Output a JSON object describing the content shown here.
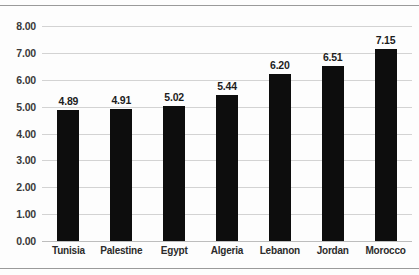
{
  "chart_data": {
    "type": "bar",
    "title": "",
    "subtitle": "",
    "xlabel": "",
    "ylabel": "",
    "categories": [
      "Tunisia",
      "Palestine",
      "Egypt",
      "Algeria",
      "Lebanon",
      "Jordan",
      "Morocco"
    ],
    "values": [
      4.89,
      4.91,
      5.02,
      5.44,
      6.2,
      6.51,
      7.15
    ],
    "value_labels": [
      "4.89",
      "4.91",
      "5.02",
      "5.44",
      "6.20",
      "6.51",
      "7.15"
    ],
    "ylim": [
      0,
      8
    ],
    "ytick_labels": [
      "0.00",
      "1.00",
      "2.00",
      "3.00",
      "4.00",
      "5.00",
      "6.00",
      "7.00",
      "8.00"
    ],
    "ytick_values": [
      0,
      1,
      2,
      3,
      4,
      5,
      6,
      7,
      8
    ],
    "grid": true,
    "legend": null,
    "legend_position": "none",
    "series": [
      {
        "name": "",
        "values": [
          4.89,
          4.91,
          5.02,
          5.44,
          6.2,
          6.51,
          7.15
        ],
        "color": "#0d0d0d"
      }
    ],
    "colors": {
      "bar": "#0d0d0d",
      "gridline": "#d3d3d3",
      "axis": "#bdbdbd",
      "text": "#2b2b2b",
      "background": "#fdfdfd"
    }
  }
}
